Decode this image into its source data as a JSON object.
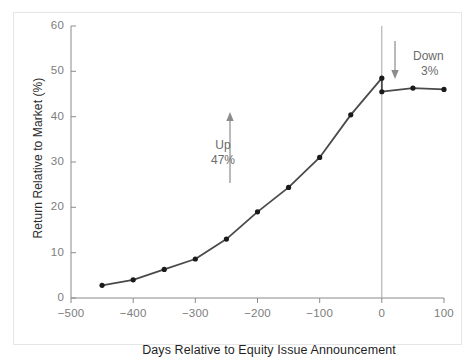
{
  "figure": {
    "background": "#ffffff",
    "frame_color": "#e6e6e6"
  },
  "annotations": {
    "up": {
      "label": "Up",
      "value": "47%",
      "arrow_icon": "arrow-up-icon"
    },
    "down": {
      "label": "Down",
      "value": "3%",
      "arrow_icon": "arrow-down-icon"
    }
  },
  "chart_data": {
    "type": "line",
    "title": "",
    "subtitle": "",
    "xlabel": "Days Relative to Equity Issue Announcement",
    "ylabel": "Return Relative to Market (%)",
    "xlim": [
      -500,
      100
    ],
    "ylim": [
      0,
      60
    ],
    "xticks": [
      -500,
      -400,
      -300,
      -200,
      -100,
      0,
      100
    ],
    "xtick_labels": [
      "−500",
      "−400",
      "−300",
      "−200",
      "−100",
      "0",
      "100"
    ],
    "yticks": [
      0,
      10,
      20,
      30,
      40,
      50,
      60
    ],
    "ytick_labels": [
      "0",
      "10",
      "20",
      "30",
      "40",
      "50",
      "60"
    ],
    "grid": false,
    "legend_position": "none",
    "line_color": "#4a4a4a",
    "marker_color": "#1a1a1a",
    "marker_style": "circle",
    "event_line": {
      "x": 0,
      "color": "#9a9a9a",
      "label": ""
    },
    "x": [
      -450,
      -400,
      -350,
      -300,
      -250,
      -200,
      -150,
      -100,
      -50,
      0,
      0,
      50,
      100
    ],
    "y": [
      2.8,
      4.0,
      6.3,
      8.6,
      13.0,
      19.0,
      24.4,
      31.0,
      40.4,
      48.5,
      45.5,
      46.3,
      46.0
    ],
    "series": [
      {
        "name": "Return Relative to Market",
        "points": [
          {
            "x": -450,
            "y": 2.8
          },
          {
            "x": -400,
            "y": 4.0
          },
          {
            "x": -350,
            "y": 6.3
          },
          {
            "x": -300,
            "y": 8.6
          },
          {
            "x": -250,
            "y": 13.0
          },
          {
            "x": -200,
            "y": 19.0
          },
          {
            "x": -150,
            "y": 24.4
          },
          {
            "x": -100,
            "y": 31.0
          },
          {
            "x": -50,
            "y": 40.4
          },
          {
            "x": 0,
            "y": 48.5
          },
          {
            "x": 0,
            "y": 45.5
          },
          {
            "x": 50,
            "y": 46.3
          },
          {
            "x": 100,
            "y": 46.0
          }
        ]
      }
    ]
  }
}
